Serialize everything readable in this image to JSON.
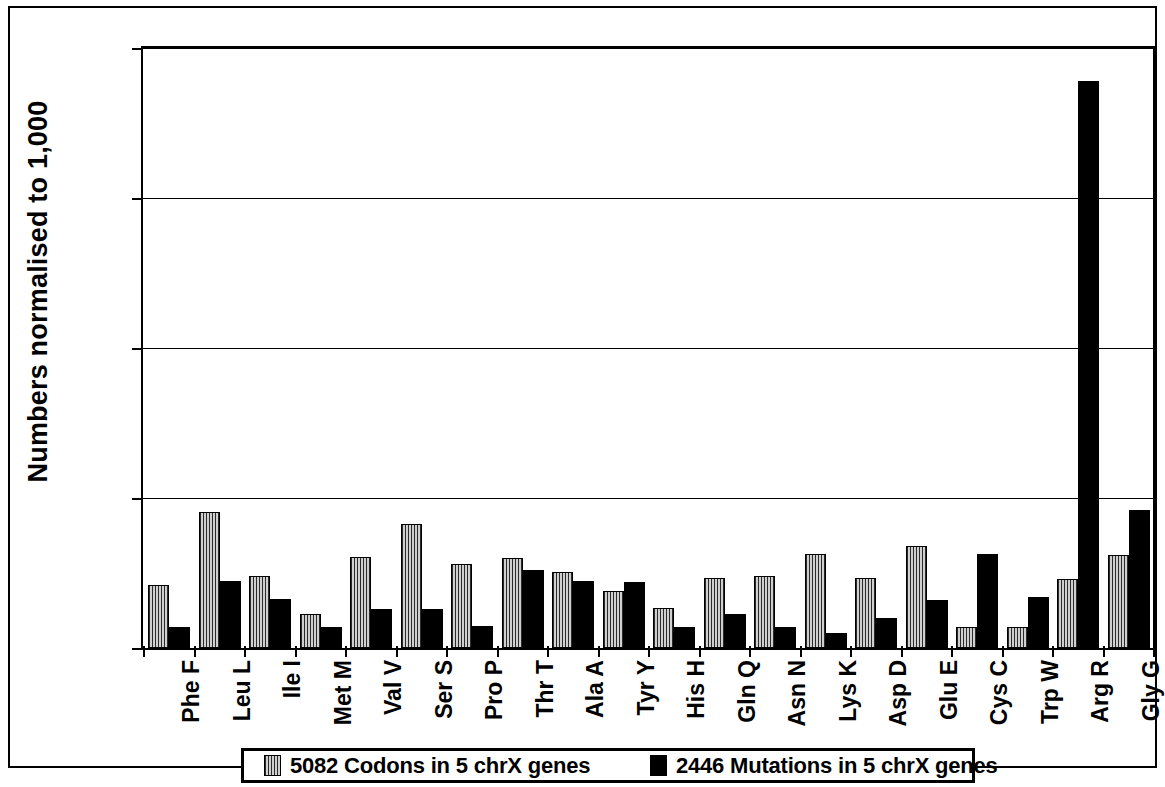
{
  "chart_data": {
    "type": "bar",
    "title": "",
    "xlabel": "",
    "ylabel": "Numbers normalised to 1,000",
    "ylim": [
      0,
      400
    ],
    "yticks": [
      0,
      100,
      200,
      300,
      400
    ],
    "ytick_labels": [
      "0",
      "100",
      "200",
      "300",
      "400"
    ],
    "grid": true,
    "legend_position": "bottom",
    "categories": [
      "Phe F",
      "Leu L",
      "Ile I",
      "Met M",
      "Val V",
      "Ser S",
      "Pro P",
      "Thr T",
      "Ala A",
      "Tyr Y",
      "His H",
      "Gln Q",
      "Asn N",
      "Lys K",
      "Asp D",
      "Glu E",
      "Cys C",
      "Trp W",
      "Arg R",
      "Gly G"
    ],
    "series": [
      {
        "name": "5082 Codons in 5 chrX genes",
        "color": "#7a7a7a",
        "pattern": "vertical-hatch",
        "values": [
          42,
          91,
          48,
          23,
          61,
          83,
          56,
          60,
          51,
          38,
          27,
          47,
          48,
          63,
          47,
          68,
          14,
          14,
          46,
          62
        ]
      },
      {
        "name": "2446 Mutations in 5 chrX genes",
        "color": "#000000",
        "pattern": "solid",
        "values": [
          14,
          45,
          33,
          14,
          26,
          26,
          15,
          52,
          45,
          44,
          14,
          23,
          14,
          10,
          20,
          32,
          63,
          34,
          378,
          92
        ]
      }
    ]
  },
  "legend": {
    "entries": [
      {
        "label": "5082 Codons in 5 chrX genes"
      },
      {
        "label": "2446 Mutations in 5 chrX genes"
      }
    ]
  }
}
